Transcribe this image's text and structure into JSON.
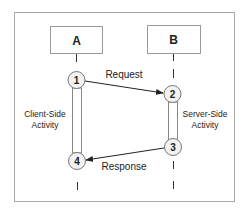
{
  "diagram": {
    "type": "sequence",
    "participants": [
      {
        "id": "A",
        "label": "A"
      },
      {
        "id": "B",
        "label": "B"
      }
    ],
    "steps": [
      {
        "num": "1"
      },
      {
        "num": "2"
      },
      {
        "num": "3"
      },
      {
        "num": "4"
      }
    ],
    "messages": [
      {
        "from": "1",
        "to": "2",
        "label": "Request"
      },
      {
        "from": "3",
        "to": "4",
        "label": "Response"
      }
    ],
    "activities": [
      {
        "participant": "A",
        "line1": "Client-Side",
        "line2": "Activity"
      },
      {
        "participant": "B",
        "line1": "Server-Side",
        "line2": "Activity"
      }
    ]
  },
  "colors": {
    "border": "#a8a8a8",
    "line": "#333333",
    "circle_fill": "#f2f2f2"
  }
}
